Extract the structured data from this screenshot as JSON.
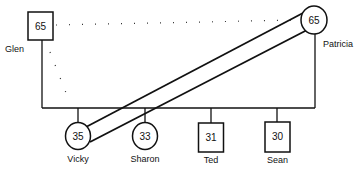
{
  "diagram": {
    "type": "genogram",
    "parents": [
      {
        "name": "Glen",
        "age": "65",
        "shape": "square"
      },
      {
        "name": "Patricia",
        "age": "65",
        "shape": "circle"
      }
    ],
    "children": [
      {
        "name": "Vicky",
        "age": "35",
        "shape": "circle"
      },
      {
        "name": "Sharon",
        "age": "33",
        "shape": "circle"
      },
      {
        "name": "Ted",
        "age": "31",
        "shape": "square"
      },
      {
        "name": "Sean",
        "age": "30",
        "shape": "square"
      }
    ],
    "relationships": [
      {
        "from": "Glen",
        "to": "Patricia",
        "style": "dotted"
      },
      {
        "from": "Glen",
        "to": "Vicky",
        "style": "dotted"
      },
      {
        "from": "Vicky",
        "to": "Patricia",
        "style": "double-line"
      }
    ],
    "colors": {
      "stroke": "#111111",
      "background": "#ffffff"
    }
  }
}
